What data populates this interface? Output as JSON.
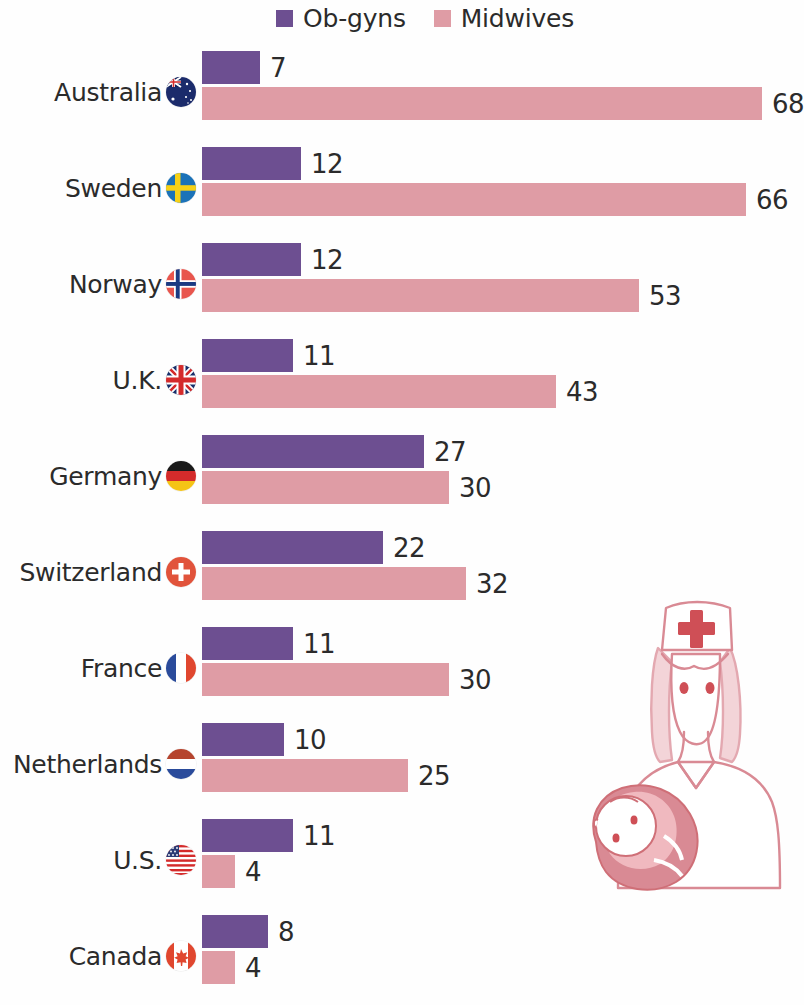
{
  "chart_data": {
    "type": "bar",
    "orientation": "horizontal",
    "title": "",
    "subtitle": "",
    "xlabel": "",
    "ylabel": "",
    "grid": false,
    "legend_position": "top",
    "categories": [
      "Australia",
      "Sweden",
      "Norway",
      "U.K.",
      "Germany",
      "Switzerland",
      "France",
      "Netherlands",
      "U.S.",
      "Canada"
    ],
    "series": [
      {
        "name": "Ob-gyns",
        "color": "#6d4f91",
        "values": [
          7,
          12,
          12,
          11,
          27,
          22,
          11,
          10,
          11,
          8
        ]
      },
      {
        "name": "Midwives",
        "color": "#df9ca5",
        "values": [
          68,
          66,
          53,
          43,
          30,
          32,
          30,
          25,
          4,
          4
        ]
      }
    ],
    "xlim": [
      0,
      68
    ],
    "value_labels_shown": true
  },
  "legend": {
    "entries": [
      {
        "label": "Ob-gyns",
        "color": "#6d4f91",
        "swatch_icon": "square-swatch-icon"
      },
      {
        "label": "Midwives",
        "color": "#df9ca5",
        "swatch_icon": "square-swatch-icon"
      }
    ]
  },
  "rows": [
    {
      "country": "Australia",
      "flag_icon": "flag-australia-icon",
      "obgyns": "7",
      "midwives": "68"
    },
    {
      "country": "Sweden",
      "flag_icon": "flag-sweden-icon",
      "obgyns": "12",
      "midwives": "66"
    },
    {
      "country": "Norway",
      "flag_icon": "flag-norway-icon",
      "obgyns": "12",
      "midwives": "53"
    },
    {
      "country": "U.K.",
      "flag_icon": "flag-uk-icon",
      "obgyns": "11",
      "midwives": "43"
    },
    {
      "country": "Germany",
      "flag_icon": "flag-germany-icon",
      "obgyns": "27",
      "midwives": "30"
    },
    {
      "country": "Switzerland",
      "flag_icon": "flag-switzerland-icon",
      "obgyns": "22",
      "midwives": "32"
    },
    {
      "country": "France",
      "flag_icon": "flag-france-icon",
      "obgyns": "11",
      "midwives": "30"
    },
    {
      "country": "Netherlands",
      "flag_icon": "flag-netherlands-icon",
      "obgyns": "10",
      "midwives": "25"
    },
    {
      "country": "U.S.",
      "flag_icon": "flag-usa-icon",
      "obgyns": "11",
      "midwives": "4"
    },
    {
      "country": "Canada",
      "flag_icon": "flag-canada-icon",
      "obgyns": "8",
      "midwives": "4"
    }
  ],
  "illustration": {
    "name": "nurse-holding-baby-illustration",
    "line_color": "#d98a94",
    "accent_color": "#cf4f56"
  }
}
